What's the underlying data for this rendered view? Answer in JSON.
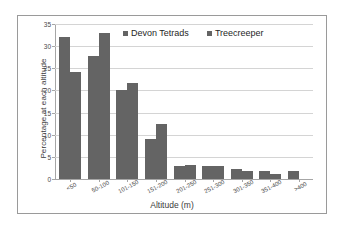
{
  "chart_data": {
    "type": "bar",
    "title": "",
    "xlabel": "Altitude (m)",
    "ylabel": "Percentage at each altitude",
    "categories": [
      "<50",
      "50-100",
      "101-150",
      "151-200",
      "201-250",
      "251-300",
      "301-350",
      "351-400",
      ">400"
    ],
    "series": [
      {
        "name": "Devon Tetrads",
        "color": "#646464",
        "values": [
          32.0,
          27.7,
          20.0,
          9.1,
          2.9,
          2.9,
          2.3,
          1.9,
          1.7
        ]
      },
      {
        "name": "Treecreeper",
        "color": "#646464",
        "values": [
          24.2,
          33.0,
          21.7,
          12.4,
          3.1,
          2.9,
          1.7,
          1.2,
          0
        ]
      }
    ],
    "ylim": [
      0,
      35
    ],
    "yticks": [
      0,
      5,
      10,
      15,
      20,
      25,
      30,
      35
    ],
    "ytick_labels": [
      "0",
      "5",
      "10",
      "15",
      "20",
      "25",
      "30",
      "35"
    ],
    "grid": true,
    "legend_position": "top-center"
  },
  "legend": {
    "entries": [
      {
        "label": "Devon Tetrads"
      },
      {
        "label": "Treecreeper"
      }
    ]
  }
}
